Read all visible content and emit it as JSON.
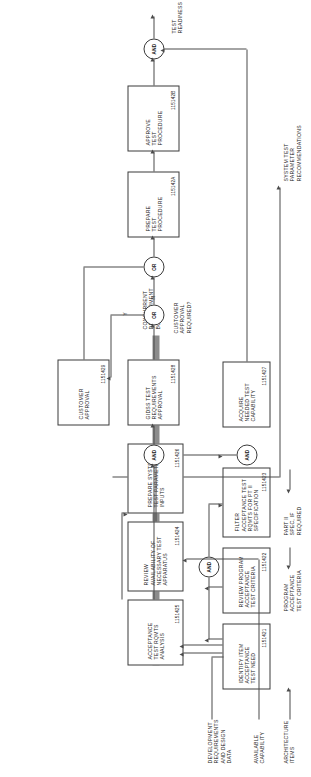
{
  "diagram": {
    "type": "flowchart",
    "orientation": "rotated-90-ccw",
    "title_visible": false,
    "bond_label": "CONCURRENT\nDEVELOPMENT\nBOND",
    "colors": {
      "line": "#4a4a4a",
      "box_border": "#3a3a3a",
      "bond_bar": "#8c8c8c",
      "background": "#ffffff",
      "text": "#1a1a1a"
    }
  },
  "inputs": [
    {
      "id": "in-available-capability",
      "label": "AVAILABLE\nCAPABILITY"
    },
    {
      "id": "in-dev-requirements",
      "label": "DEVELOPMENT\nREQUIREMENTS\nAND DESIGN\nDATA"
    },
    {
      "id": "in-architecture-items",
      "label": "ARCHITECTURE\nITEMS"
    },
    {
      "id": "in-program-criteria",
      "label": "PROGRAM\nACCEPTANCE\nTEST CRITERIA"
    },
    {
      "id": "in-part-ii-spec",
      "label": "PART II\nSPEC, IF\nREQUIRED"
    }
  ],
  "outputs": [
    {
      "id": "out-test-readiness",
      "label": "TEST\nREADINESS"
    },
    {
      "id": "out-system-test-params",
      "label": "SYSTEM TEST\nPARAMETER\nRECOMMENDATIONS"
    }
  ],
  "boxes": [
    {
      "id": "box-1151421",
      "title": "IDENTIFY ITEM\nACCEPTANCE\nTEST NEED",
      "refno": "1151421"
    },
    {
      "id": "box-1151422",
      "title": "REVIEW PROGRAM\nACCEPTANCE\nTEST CRITERIA",
      "refno": "1151422"
    },
    {
      "id": "box-1151423",
      "title": "FILTER\nACCEPTANCE TEST\nRQMTS FOR PT II\nSPECIFICATION",
      "refno": "1151423"
    },
    {
      "id": "box-1151424",
      "title": "REVIEW\nAVAILABILITY OF\nNECESSARY TEST\nAPPARATUS",
      "refno": "1151424"
    },
    {
      "id": "box-1151425",
      "title": "ACCEPTANCE\nTEST RQMTS\nANALYSIS",
      "refno": "1151425"
    },
    {
      "id": "box-1151426",
      "title": "PREPARE SYSTEM\nTEST PARAMETER\nINPUTS",
      "refno": "1151426"
    },
    {
      "id": "box-1151427",
      "title": "ACQUIRE\nNEEDED TEST\nCAPABILITY",
      "refno": "1151427"
    },
    {
      "id": "box-1151428",
      "title": "GIDSS TEST\nREQUIREMENTS\nAPPROVAL",
      "refno": "1151428"
    },
    {
      "id": "box-1151429",
      "title": "CUSTOMER\nAPPROVAL",
      "refno": "1151429"
    },
    {
      "id": "box-115142A",
      "title": "PREPARE\nTEST\nPROCEDURE",
      "refno": "115142A"
    },
    {
      "id": "box-115142B",
      "title": "APPROVE\nTEST\nPROCEDURE",
      "refno": "115142B"
    }
  ],
  "gates": [
    {
      "id": "gate-and-1",
      "label": "AND"
    },
    {
      "id": "gate-and-2",
      "label": "AND"
    },
    {
      "id": "gate-and-3",
      "label": "AND"
    },
    {
      "id": "gate-and-4",
      "label": "AND"
    },
    {
      "id": "gate-or-1",
      "label": "OR"
    },
    {
      "id": "gate-or-2",
      "label": "OR"
    }
  ],
  "decision": {
    "question": "CUSTOMER\nAPPROVAL\nREQUIRED?",
    "branch_yes": "Y",
    "branch_no": "N"
  }
}
